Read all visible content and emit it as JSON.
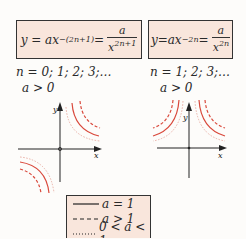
{
  "formulas": [
    {
      "lhs": "y = ax",
      "exp": "−(2n+1)",
      "eq": " =",
      "num": "a",
      "den_base": "x",
      "den_exp": "2n+1"
    },
    {
      "lhs": "y=ax",
      "exp": "−2n",
      "eq": " =",
      "num": "a",
      "den_base": "x",
      "den_exp": "2n"
    }
  ],
  "conditions": [
    {
      "n_values": "n = 0; 1; 2; 3;…",
      "a_cond": "a > 0"
    },
    {
      "n_values": "n = 1; 2; 3;…",
      "a_cond": "a > 0"
    }
  ],
  "axes": {
    "x_label": "x",
    "y_label": "y"
  },
  "legend": {
    "items": [
      {
        "style": "solid",
        "label": "a = 1"
      },
      {
        "style": "dashed",
        "label": "a > 1"
      },
      {
        "style": "dotted",
        "label": "0 < a < 1"
      }
    ]
  },
  "colors": {
    "curve": "#d9483b",
    "curve_light": "#eab0a6",
    "box_fill": "#f9e6dc",
    "axis": "#222222"
  }
}
